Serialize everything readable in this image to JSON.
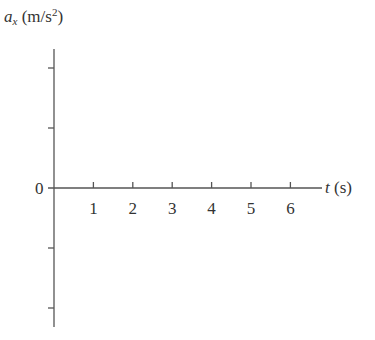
{
  "chart_data": {
    "type": "line",
    "title": "",
    "xlabel": "t (s)",
    "ylabel": "a_x (m/s^2)",
    "ylabel_parts": {
      "symbol": "a",
      "subscript": "x",
      "unit_open": " (m/s",
      "unit_power": "2",
      "unit_close": ")"
    },
    "xlabel_parts": {
      "symbol": "t",
      "unit": " (s)"
    },
    "x_ticks": [
      1,
      2,
      3,
      4,
      5,
      6
    ],
    "x_tick_labels": [
      "1",
      "2",
      "3",
      "4",
      "5",
      "6"
    ],
    "y_tick_labels": [
      "0"
    ],
    "y_ticks_unlabeled_count": 4,
    "xlim": [
      0,
      7
    ],
    "ylim": [
      -2.3,
      2.3
    ],
    "grid": false,
    "legend": null,
    "series": []
  },
  "labels": {
    "zero": "0"
  }
}
